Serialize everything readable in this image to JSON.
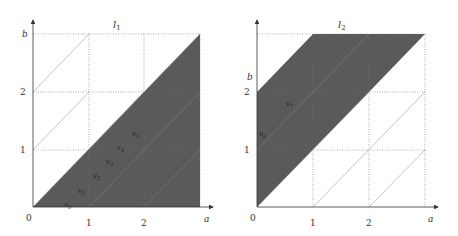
{
  "diagrams": [
    {
      "title": "l",
      "title_sub": "1",
      "x_axis_label": "a",
      "y_axis_label": "b",
      "origin_label": "0",
      "x_ticks": [
        "1",
        "2"
      ],
      "y_ticks": [
        "1",
        "2"
      ],
      "region_labels": [
        {
          "name": "v",
          "sub": "0"
        },
        {
          "name": "v",
          "sub": "1"
        },
        {
          "name": "v",
          "sub": "2"
        },
        {
          "name": "v",
          "sub": "3"
        },
        {
          "name": "v",
          "sub": "4"
        },
        {
          "name": "v",
          "sub": "5"
        }
      ],
      "shaded_region": "below diagonal b = a"
    },
    {
      "title": "l",
      "title_sub": "2",
      "x_axis_label": "a",
      "y_axis_label": "b",
      "origin_label": "0",
      "x_ticks": [
        "1",
        "2"
      ],
      "y_ticks": [
        "1",
        "2"
      ],
      "region_labels": [
        {
          "name": "v",
          "sub": "6"
        },
        {
          "name": "v",
          "sub": "7"
        }
      ],
      "shaded_region": "between b = a and b = a + 2"
    }
  ],
  "colors": {
    "shade": "#5a5a5a",
    "grid": "#777777",
    "axis": "#333333",
    "background": "#ffffff"
  }
}
